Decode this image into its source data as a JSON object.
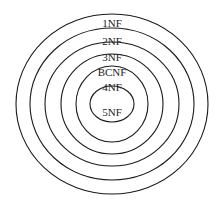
{
  "diagram": {
    "type": "nested-ellipses",
    "center": {
      "x": 112,
      "y": 104
    },
    "stroke_color": "#1a1a1a",
    "levels": [
      {
        "label": "1NF",
        "rx": 96,
        "ry": 90,
        "label_y": 27
      },
      {
        "label": "2NF",
        "rx": 82,
        "ry": 76,
        "label_y": 45
      },
      {
        "label": "3NF",
        "rx": 67,
        "ry": 62,
        "label_y": 61
      },
      {
        "label": "BCNF",
        "rx": 51,
        "ry": 50,
        "label_y": 76
      },
      {
        "label": "4NF",
        "rx": 36,
        "ry": 38,
        "label_y": 91
      },
      {
        "label": "5NF",
        "rx": 22,
        "ry": 18,
        "label_y": 116
      }
    ]
  }
}
